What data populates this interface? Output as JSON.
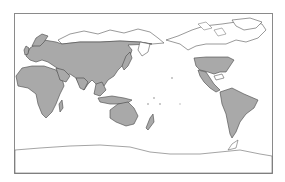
{
  "map": {
    "type": "world-map",
    "projection": "equirectangular, Pacific-centered",
    "center_longitude": "150E",
    "colors": {
      "shaded_fill": "#a9a9a9",
      "unshaded_fill": "#ffffff",
      "outline": "#555555",
      "frame": "#8a8a8a"
    },
    "shaded_regions": [
      "Europe",
      "Africa",
      "Middle East",
      "Asia (south of Arctic belt)",
      "Japan",
      "Southeast Asia",
      "Indonesia",
      "Australia",
      "New Zealand",
      "United States",
      "Mexico",
      "Central America",
      "South America"
    ],
    "unshaded_regions": [
      "Arctic Siberia",
      "Canada",
      "Alaska",
      "Greenland",
      "Antarctica",
      "Pacific Ocean islands"
    ],
    "legend": null,
    "title": null
  }
}
